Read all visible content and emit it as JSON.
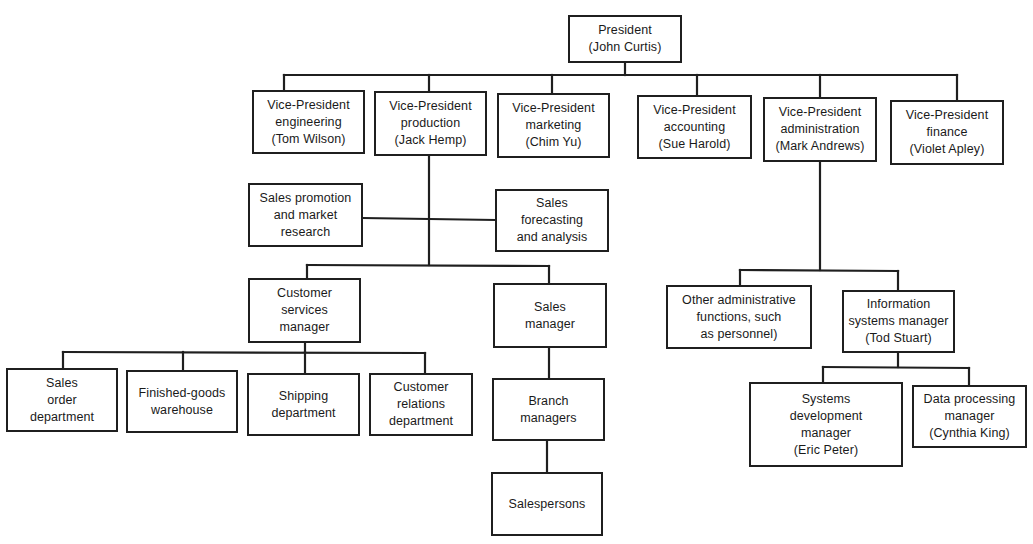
{
  "chart": {
    "type": "organization-chart",
    "line_color": "#1f1f1f",
    "background": "#ffffff"
  },
  "nodes": {
    "president": {
      "lines": [
        "President",
        "(John Curtis)"
      ],
      "box": [
        568,
        15,
        114,
        48
      ]
    },
    "vp_engineering": {
      "lines": [
        "Vice-President",
        "engineering",
        "(Tom Wilson)"
      ],
      "box": [
        252,
        90,
        113,
        64
      ]
    },
    "vp_production": {
      "lines": [
        "Vice-President",
        "production",
        "(Jack Hemp)"
      ],
      "box": [
        374,
        91,
        113,
        65
      ]
    },
    "vp_marketing": {
      "lines": [
        "Vice-President",
        "marketing",
        "(Chim Yu)"
      ],
      "box": [
        497,
        93,
        113,
        65
      ]
    },
    "vp_accounting": {
      "lines": [
        "Vice-President",
        "accounting",
        "(Sue Harold)"
      ],
      "box": [
        637,
        95,
        115,
        64
      ]
    },
    "vp_administration": {
      "lines": [
        "Vice-President",
        "administration",
        "(Mark Andrews)"
      ],
      "box": [
        763,
        97,
        114,
        65
      ]
    },
    "vp_finance": {
      "lines": [
        "Vice-President",
        "finance",
        "(Violet Apley)"
      ],
      "box": [
        890,
        100,
        114,
        65
      ]
    },
    "sales_promotion": {
      "lines": [
        "Sales promotion",
        "and market",
        "research"
      ],
      "box": [
        248,
        183,
        115,
        64
      ]
    },
    "sales_forecasting": {
      "lines": [
        "Sales",
        "forecasting",
        "and analysis"
      ],
      "box": [
        495,
        189,
        114,
        63
      ]
    },
    "customer_services_manager": {
      "lines": [
        "Customer",
        "services",
        "manager"
      ],
      "box": [
        248,
        278,
        113,
        65
      ]
    },
    "sales_manager": {
      "lines": [
        "Sales",
        "manager"
      ],
      "box": [
        493,
        283,
        114,
        65
      ]
    },
    "sales_order_department": {
      "lines": [
        "Sales",
        "order",
        "department"
      ],
      "box": [
        6,
        368,
        112,
        64
      ]
    },
    "finished_goods_warehouse": {
      "lines": [
        "Finished-goods",
        "warehouse"
      ],
      "box": [
        126,
        370,
        112,
        63
      ]
    },
    "shipping_department": {
      "lines": [
        "Shipping",
        "department"
      ],
      "box": [
        247,
        373,
        113,
        63
      ]
    },
    "customer_relations_department": {
      "lines": [
        "Customer",
        "relations",
        "department"
      ],
      "box": [
        369,
        373,
        104,
        63
      ]
    },
    "branch_managers": {
      "lines": [
        "Branch",
        "managers"
      ],
      "box": [
        492,
        378,
        113,
        63
      ]
    },
    "salespersons": {
      "lines": [
        "Salespersons"
      ],
      "box": [
        491,
        472,
        112,
        64
      ]
    },
    "other_admin_functions": {
      "lines": [
        "Other administrative",
        "functions, such",
        "as personnel)"
      ],
      "box": [
        666,
        285,
        146,
        64
      ]
    },
    "info_systems_manager": {
      "lines": [
        "Information",
        "systems manager",
        "(Tod Stuart)"
      ],
      "box": [
        842,
        290,
        113,
        63
      ]
    },
    "systems_development_manager": {
      "lines": [
        "Systems",
        "development",
        "manager",
        "(Eric Peter)"
      ],
      "box": [
        749,
        382,
        154,
        85
      ]
    },
    "data_processing_manager": {
      "lines": [
        "Data processing",
        "manager",
        "(Cynthia King)"
      ],
      "box": [
        912,
        385,
        115,
        63
      ]
    }
  },
  "connectors": [
    [
      [
        625,
        63
      ],
      [
        625,
        75
      ]
    ],
    [
      [
        284,
        75
      ],
      [
        957,
        75
      ]
    ],
    [
      [
        284,
        75
      ],
      [
        284,
        90
      ]
    ],
    [
      [
        429,
        75
      ],
      [
        429,
        91
      ]
    ],
    [
      [
        552,
        75
      ],
      [
        552,
        93
      ]
    ],
    [
      [
        697,
        75
      ],
      [
        697,
        95
      ]
    ],
    [
      [
        820,
        75
      ],
      [
        820,
        97
      ]
    ],
    [
      [
        957,
        75
      ],
      [
        957,
        100
      ]
    ],
    [
      [
        429,
        156
      ],
      [
        429,
        265
      ]
    ],
    [
      [
        363,
        218
      ],
      [
        495,
        220
      ]
    ],
    [
      [
        307,
        265
      ],
      [
        549,
        266
      ]
    ],
    [
      [
        307,
        265
      ],
      [
        307,
        278
      ]
    ],
    [
      [
        549,
        266
      ],
      [
        549,
        283
      ]
    ],
    [
      [
        305,
        343
      ],
      [
        305,
        352
      ]
    ],
    [
      [
        63,
        352
      ],
      [
        425,
        353
      ]
    ],
    [
      [
        63,
        352
      ],
      [
        63,
        368
      ]
    ],
    [
      [
        183,
        352
      ],
      [
        183,
        370
      ]
    ],
    [
      [
        305,
        352
      ],
      [
        305,
        373
      ]
    ],
    [
      [
        425,
        353
      ],
      [
        425,
        373
      ]
    ],
    [
      [
        549,
        348
      ],
      [
        549,
        378
      ]
    ],
    [
      [
        547,
        441
      ],
      [
        547,
        472
      ]
    ],
    [
      [
        820,
        162
      ],
      [
        820,
        270
      ]
    ],
    [
      [
        740,
        270
      ],
      [
        898,
        271
      ]
    ],
    [
      [
        740,
        270
      ],
      [
        740,
        285
      ]
    ],
    [
      [
        898,
        271
      ],
      [
        898,
        290
      ]
    ],
    [
      [
        898,
        353
      ],
      [
        898,
        367
      ]
    ],
    [
      [
        823,
        367
      ],
      [
        969,
        368
      ]
    ],
    [
      [
        823,
        367
      ],
      [
        823,
        382
      ]
    ],
    [
      [
        969,
        368
      ],
      [
        969,
        385
      ]
    ]
  ]
}
